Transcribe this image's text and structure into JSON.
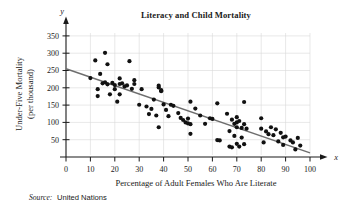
{
  "figure": {
    "title": "Literacy and Child Mortality",
    "source_label": "Source:",
    "source_value": "United Nations",
    "x_axis_var": "x",
    "y_axis_var": "y"
  },
  "chart_data": {
    "type": "scatter",
    "title": "Literacy and Child Mortality",
    "xlabel": "Percentage of Adult Females Who Are Literate",
    "ylabel": "Under-Five Mortality (per thousand)",
    "ylabel_line1": "Under-Five Mortality",
    "ylabel_line2": "(per thousand)",
    "xlim": [
      0,
      100
    ],
    "ylim": [
      0,
      370
    ],
    "xticks": [
      0,
      10,
      20,
      30,
      40,
      50,
      60,
      70,
      80,
      90,
      100
    ],
    "yticks": [
      50,
      100,
      150,
      200,
      250,
      300,
      350
    ],
    "grid": true,
    "legend": "none",
    "point_color": "#111111",
    "trendline_color": "#6e6e6e",
    "grid_color": "#d8d8d8",
    "trendline": {
      "label": "line of best fit",
      "x0": 0,
      "y0": 255,
      "x1": 100,
      "y1": 12
    },
    "series": [
      {
        "name": "Countries",
        "points": [
          [
            10,
            228
          ],
          [
            12,
            279
          ],
          [
            13,
            196
          ],
          [
            13,
            176
          ],
          [
            14,
            240
          ],
          [
            15,
            213
          ],
          [
            16,
            301
          ],
          [
            16,
            216
          ],
          [
            17,
            268
          ],
          [
            17,
            210
          ],
          [
            18,
            181
          ],
          [
            19,
            214
          ],
          [
            20,
            208
          ],
          [
            20,
            196
          ],
          [
            21,
            160
          ],
          [
            22,
            227
          ],
          [
            22,
            211
          ],
          [
            22,
            181
          ],
          [
            23,
            213
          ],
          [
            24,
            204
          ],
          [
            25,
            207
          ],
          [
            26,
            277
          ],
          [
            27,
            197
          ],
          [
            28,
            222
          ],
          [
            28,
            211
          ],
          [
            30,
            151
          ],
          [
            31,
            196
          ],
          [
            33,
            146
          ],
          [
            34,
            124
          ],
          [
            35,
            139
          ],
          [
            36,
            166
          ],
          [
            37,
            120
          ],
          [
            38,
            201
          ],
          [
            38,
            206
          ],
          [
            38,
            86
          ],
          [
            39,
            193
          ],
          [
            39,
            190
          ],
          [
            40,
            152
          ],
          [
            41,
            136
          ],
          [
            42,
            118
          ],
          [
            43,
            151
          ],
          [
            44,
            148
          ],
          [
            46,
            127
          ],
          [
            47,
            113
          ],
          [
            48,
            107
          ],
          [
            49,
            100
          ],
          [
            50,
            97
          ],
          [
            50,
            111
          ],
          [
            51,
            160
          ],
          [
            51,
            95
          ],
          [
            51,
            67
          ],
          [
            53,
            140
          ],
          [
            55,
            120
          ],
          [
            57,
            96
          ],
          [
            59,
            112
          ],
          [
            60,
            110
          ],
          [
            62,
            155
          ],
          [
            62,
            49
          ],
          [
            63,
            48
          ],
          [
            66,
            125
          ],
          [
            67,
            75
          ],
          [
            67,
            30
          ],
          [
            68,
            108
          ],
          [
            68,
            28
          ],
          [
            69,
            96
          ],
          [
            69,
            61
          ],
          [
            70,
            115
          ],
          [
            70,
            100
          ],
          [
            70,
            86
          ],
          [
            70,
            38
          ],
          [
            71,
            104
          ],
          [
            71,
            30
          ],
          [
            72,
            84
          ],
          [
            72,
            56
          ],
          [
            73,
            159
          ],
          [
            73,
            95
          ],
          [
            73,
            37
          ],
          [
            74,
            82
          ],
          [
            80,
            112
          ],
          [
            80,
            82
          ],
          [
            81,
            42
          ],
          [
            82,
            74
          ],
          [
            83,
            66
          ],
          [
            84,
            86
          ],
          [
            85,
            63
          ],
          [
            86,
            80
          ],
          [
            87,
            45
          ],
          [
            88,
            70
          ],
          [
            89,
            57
          ],
          [
            89,
            35
          ],
          [
            90,
            59
          ],
          [
            92,
            48
          ],
          [
            93,
            42
          ],
          [
            94,
            22
          ],
          [
            95,
            55
          ],
          [
            96,
            33
          ]
        ]
      }
    ]
  }
}
